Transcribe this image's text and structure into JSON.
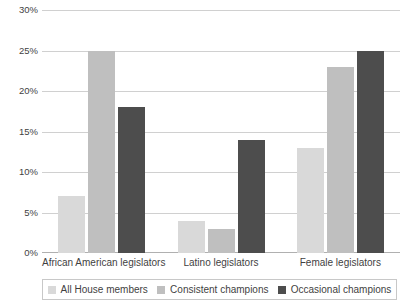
{
  "chart_data": {
    "type": "bar",
    "title": "",
    "subtitle": "",
    "xlabel": "",
    "ylabel": "",
    "ylim": [
      0,
      30
    ],
    "ytick_values": [
      0,
      5,
      10,
      15,
      20,
      25,
      30
    ],
    "ytick_labels": [
      "0%",
      "5%",
      "10%",
      "15%",
      "20%",
      "25%",
      "30%"
    ],
    "grid": true,
    "legend_position": "bottom",
    "categories": [
      "African American legislators",
      "Latino legislators",
      "Female legislators"
    ],
    "series": [
      {
        "name": "All House members",
        "color": "#d9d9d9",
        "values": [
          7,
          4,
          13
        ]
      },
      {
        "name": "Consistent champions",
        "color": "#bfbfbf",
        "values": [
          25,
          3,
          23
        ]
      },
      {
        "name": "Occasional champions",
        "color": "#4d4d4d",
        "values": [
          18,
          14,
          25
        ]
      }
    ]
  },
  "colors": {
    "series_light": "#d9d9d9",
    "series_medium": "#bfbfbf",
    "series_dark": "#4d4d4d",
    "gridline": "#d0d0d0",
    "axis": "#b0b0b0",
    "text": "#3f3f3f",
    "background": "#ffffff"
  }
}
